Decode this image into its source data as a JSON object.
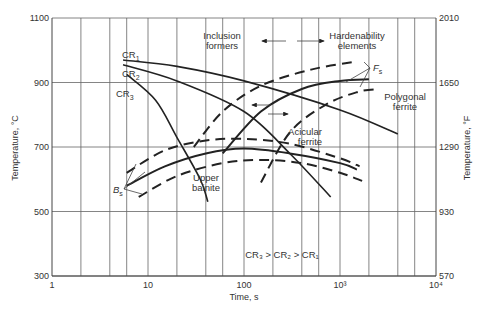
{
  "chart_data": {
    "type": "line",
    "title": "",
    "xlabel": "Time, s",
    "ylabel": "Temperature, °C",
    "ylabel_right": "Temperature, °F",
    "xscale": "log",
    "xlim": [
      1,
      10000
    ],
    "ylim": [
      300,
      1100
    ],
    "grid": true,
    "x_ticks": [
      {
        "value": 1,
        "label": "1"
      },
      {
        "value": 10,
        "label": "10"
      },
      {
        "value": 100,
        "label": "100"
      },
      {
        "value": 1000,
        "label": "10³"
      },
      {
        "value": 10000,
        "label": "10⁴"
      }
    ],
    "x_minor_grid": [
      2,
      4,
      6
    ],
    "y_ticks": [
      {
        "value": 300,
        "label": "300"
      },
      {
        "value": 500,
        "label": "500"
      },
      {
        "value": 700,
        "label": "700"
      },
      {
        "value": 900,
        "label": "900"
      },
      {
        "value": 1100,
        "label": "1100"
      }
    ],
    "y_ticks_right": [
      {
        "value": 300,
        "label": "570"
      },
      {
        "value": 500,
        "label": "930"
      },
      {
        "value": 700,
        "label": "1290"
      },
      {
        "value": 900,
        "label": "1650"
      },
      {
        "value": 1100,
        "label": "2010"
      }
    ],
    "series": [
      {
        "name": "CR1",
        "style": "cooling",
        "points": [
          [
            5.5,
            970
          ],
          [
            20,
            950
          ],
          [
            100,
            905
          ],
          [
            1000,
            815
          ],
          [
            4000,
            740
          ]
        ]
      },
      {
        "name": "CR2",
        "style": "cooling",
        "points": [
          [
            5.5,
            955
          ],
          [
            20,
            905
          ],
          [
            100,
            810
          ],
          [
            300,
            680
          ],
          [
            800,
            545
          ]
        ]
      },
      {
        "name": "CR3",
        "style": "cooling",
        "points": [
          [
            6,
            925
          ],
          [
            12,
            845
          ],
          [
            20,
            730
          ],
          [
            35,
            600
          ],
          [
            42,
            530
          ]
        ]
      },
      {
        "name": "Fs dashed (left shift)",
        "style": "dashed",
        "points": [
          [
            30,
            700
          ],
          [
            60,
            810
          ],
          [
            150,
            890
          ],
          [
            500,
            940
          ],
          [
            1500,
            965
          ]
        ]
      },
      {
        "name": "Fs solid",
        "style": "solid",
        "points": [
          [
            60,
            680
          ],
          [
            150,
            810
          ],
          [
            400,
            880
          ],
          [
            1000,
            905
          ],
          [
            2000,
            910
          ]
        ]
      },
      {
        "name": "Fs dashed (right shift)",
        "style": "dashed",
        "points": [
          [
            150,
            590
          ],
          [
            300,
            745
          ],
          [
            700,
            830
          ],
          [
            1500,
            870
          ],
          [
            2500,
            880
          ]
        ]
      },
      {
        "name": "Bs dashed (upper)",
        "style": "dashed",
        "points": [
          [
            6,
            620
          ],
          [
            15,
            690
          ],
          [
            40,
            720
          ],
          [
            100,
            725
          ],
          [
            300,
            710
          ],
          [
            1000,
            665
          ],
          [
            1600,
            640
          ]
        ]
      },
      {
        "name": "Bs solid",
        "style": "solid",
        "points": [
          [
            6,
            580
          ],
          [
            15,
            640
          ],
          [
            40,
            680
          ],
          [
            100,
            695
          ],
          [
            300,
            680
          ],
          [
            1000,
            650
          ],
          [
            1500,
            630
          ]
        ]
      },
      {
        "name": "Bs dashed (lower)",
        "style": "dashed",
        "points": [
          [
            8,
            545
          ],
          [
            20,
            610
          ],
          [
            60,
            650
          ],
          [
            150,
            660
          ],
          [
            400,
            650
          ],
          [
            1000,
            620
          ],
          [
            1700,
            595
          ]
        ]
      }
    ],
    "annotations": [
      {
        "text": "CR₁",
        "near": "top-left curves"
      },
      {
        "text": "CR₂",
        "near": "top-left curves"
      },
      {
        "text": "CR₃",
        "near": "top-left curves"
      },
      {
        "text": "Inclusion formers",
        "arrow": "left"
      },
      {
        "text": "Hardenability elements",
        "arrow": "right"
      },
      {
        "text": "F_s",
        "near": "top-right"
      },
      {
        "text": "Polygonal ferrite"
      },
      {
        "text": "Acicular ferrite"
      },
      {
        "text": "Upper bainite"
      },
      {
        "text": "B_s",
        "near": "left"
      },
      {
        "text": "CR₃ > CR₂ > CR₁"
      }
    ]
  },
  "labels": {
    "cr1": "CR",
    "cr2": "CR",
    "cr3": "CR",
    "sub1": "1",
    "sub2": "2",
    "sub3": "3",
    "inclusion1": "Inclusion",
    "inclusion2": "formers",
    "harden1": "Hardenability",
    "harden2": "elements",
    "fs": "F",
    "fs_sub": "s",
    "bs": "B",
    "bs_sub": "s",
    "poly1": "Polygonal",
    "poly2": "ferrite",
    "acic1": "Acicular",
    "acic2": "ferrite",
    "upper1": "Upper",
    "upper2": "bainite",
    "cr_order": "CR₃ > CR₂ > CR₁",
    "xlabel": "Time, s",
    "ylabel": "Temperature, °C",
    "ylabel_right": "Temperature, °F"
  }
}
